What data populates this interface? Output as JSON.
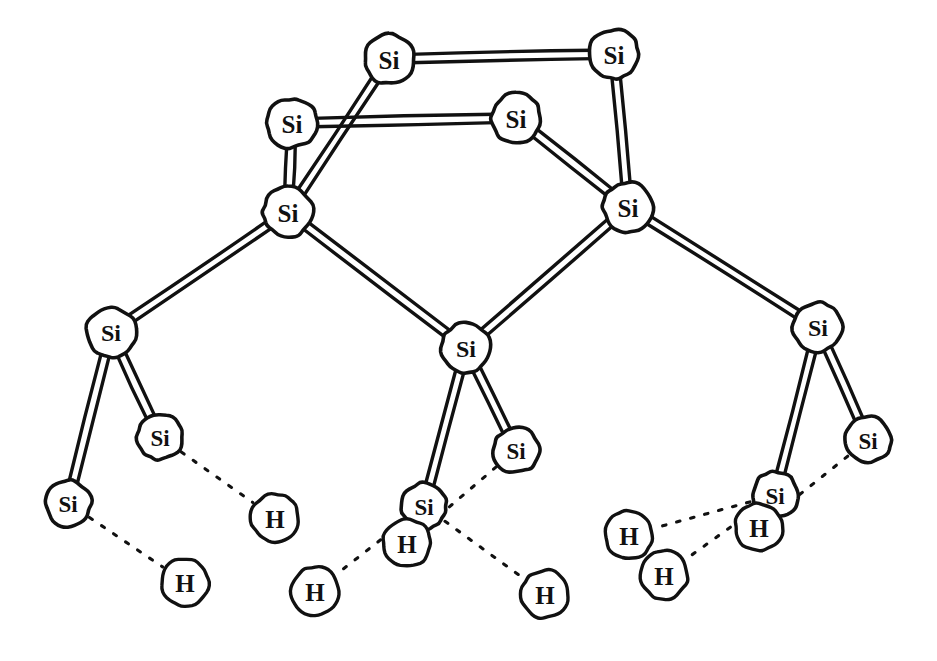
{
  "figure": {
    "background_color": "#ffffff",
    "ink_color": "#111111",
    "node_fill": "#ffffff",
    "style": "hand-drawn line art, double-line (tube) covalent bonds, dotted bonds to hydrogen"
  },
  "labels": {
    "silicon": "Si",
    "hydrogen": "H"
  },
  "atoms": [
    {
      "id": "si-top-left",
      "element": "Si",
      "x": 389,
      "y": 59,
      "r": 25,
      "font": 25,
      "layer": "top"
    },
    {
      "id": "si-top-right",
      "element": "Si",
      "x": 614,
      "y": 54,
      "r": 25,
      "font": 25,
      "layer": "top"
    },
    {
      "id": "si-row2-left",
      "element": "Si",
      "x": 292,
      "y": 123,
      "r": 25,
      "font": 25,
      "layer": "row2"
    },
    {
      "id": "si-row2-right",
      "element": "Si",
      "x": 516,
      "y": 118,
      "r": 25,
      "font": 25,
      "layer": "row2"
    },
    {
      "id": "si-row3-left",
      "element": "Si",
      "x": 288,
      "y": 212,
      "r": 25,
      "font": 25,
      "layer": "row3"
    },
    {
      "id": "si-row3-right",
      "element": "Si",
      "x": 628,
      "y": 207,
      "r": 25,
      "font": 25,
      "layer": "row3"
    },
    {
      "id": "si-row4-left",
      "element": "Si",
      "x": 111,
      "y": 332,
      "r": 25,
      "font": 24,
      "layer": "row4"
    },
    {
      "id": "si-row4-center",
      "element": "Si",
      "x": 466,
      "y": 348,
      "r": 25,
      "font": 24,
      "layer": "row4"
    },
    {
      "id": "si-row4-right",
      "element": "Si",
      "x": 818,
      "y": 327,
      "r": 25,
      "font": 24,
      "layer": "row4"
    },
    {
      "id": "si-row5-left",
      "element": "Si",
      "x": 160,
      "y": 437,
      "r": 23,
      "font": 23,
      "layer": "row5"
    },
    {
      "id": "si-row5-midleft",
      "element": "Si",
      "x": 68,
      "y": 503,
      "r": 23,
      "font": 23,
      "layer": "row5"
    },
    {
      "id": "si-row5-center",
      "element": "Si",
      "x": 516,
      "y": 450,
      "r": 23,
      "font": 23,
      "layer": "row5"
    },
    {
      "id": "si-row5-centerleft",
      "element": "Si",
      "x": 424,
      "y": 506,
      "r": 23,
      "font": 23,
      "layer": "row5"
    },
    {
      "id": "si-row5-right",
      "element": "Si",
      "x": 868,
      "y": 440,
      "r": 23,
      "font": 23,
      "layer": "row5"
    },
    {
      "id": "si-row5-midright",
      "element": "Si",
      "x": 775,
      "y": 495,
      "r": 23,
      "font": 23,
      "layer": "row5"
    },
    {
      "id": "h-left-upper",
      "element": "H",
      "x": 275,
      "y": 518,
      "r": 24,
      "font": 25,
      "layer": "h"
    },
    {
      "id": "h-left-lower",
      "element": "H",
      "x": 185,
      "y": 582,
      "r": 24,
      "font": 25,
      "layer": "h"
    },
    {
      "id": "h-center-left",
      "element": "H",
      "x": 315,
      "y": 591,
      "r": 24,
      "font": 25,
      "layer": "h"
    },
    {
      "id": "h-center-overlap",
      "element": "H",
      "x": 407,
      "y": 543,
      "r": 24,
      "font": 25,
      "layer": "h"
    },
    {
      "id": "h-center-right",
      "element": "H",
      "x": 545,
      "y": 594,
      "r": 24,
      "font": 25,
      "layer": "h"
    },
    {
      "id": "h-right-upper",
      "element": "H",
      "x": 629,
      "y": 535,
      "r": 24,
      "font": 25,
      "layer": "h"
    },
    {
      "id": "h-right-lower",
      "element": "H",
      "x": 664,
      "y": 575,
      "r": 24,
      "font": 25,
      "layer": "h"
    },
    {
      "id": "h-right-overlap",
      "element": "H",
      "x": 759,
      "y": 527,
      "r": 24,
      "font": 25,
      "layer": "h"
    }
  ],
  "bonds": [
    {
      "from": "si-top-left",
      "to": "si-top-right",
      "kind": "tube"
    },
    {
      "from": "si-row2-left",
      "to": "si-row2-right",
      "kind": "tube"
    },
    {
      "from": "si-top-left",
      "to": "si-row3-left",
      "kind": "tube"
    },
    {
      "from": "si-top-right",
      "to": "si-row3-right",
      "kind": "tube"
    },
    {
      "from": "si-row2-left",
      "to": "si-row3-left",
      "kind": "tube"
    },
    {
      "from": "si-row2-right",
      "to": "si-row3-right",
      "kind": "tube"
    },
    {
      "from": "si-row3-left",
      "to": "si-row4-left",
      "kind": "tube"
    },
    {
      "from": "si-row3-left",
      "to": "si-row4-center",
      "kind": "tube"
    },
    {
      "from": "si-row3-right",
      "to": "si-row4-center",
      "kind": "tube"
    },
    {
      "from": "si-row3-right",
      "to": "si-row4-right",
      "kind": "tube"
    },
    {
      "from": "si-row4-left",
      "to": "si-row5-left",
      "kind": "tube"
    },
    {
      "from": "si-row4-left",
      "to": "si-row5-midleft",
      "kind": "tube"
    },
    {
      "from": "si-row4-center",
      "to": "si-row5-center",
      "kind": "tube"
    },
    {
      "from": "si-row4-center",
      "to": "si-row5-centerleft",
      "kind": "tube"
    },
    {
      "from": "si-row4-right",
      "to": "si-row5-right",
      "kind": "tube"
    },
    {
      "from": "si-row4-right",
      "to": "si-row5-midright",
      "kind": "tube"
    },
    {
      "from": "si-row5-left",
      "to": "h-left-upper",
      "kind": "dotted"
    },
    {
      "from": "si-row5-midleft",
      "to": "h-left-lower",
      "kind": "dotted"
    },
    {
      "from": "si-row5-centerleft",
      "to": "h-center-left",
      "kind": "dotted"
    },
    {
      "from": "si-row5-center",
      "to": "h-center-overlap",
      "kind": "dotted"
    },
    {
      "from": "si-row5-centerleft",
      "to": "h-center-right",
      "kind": "dotted"
    },
    {
      "from": "si-row5-midright",
      "to": "h-right-upper",
      "kind": "dotted"
    },
    {
      "from": "si-row5-midright",
      "to": "h-right-lower",
      "kind": "dotted"
    },
    {
      "from": "si-row5-right",
      "to": "h-right-overlap",
      "kind": "dotted"
    }
  ]
}
